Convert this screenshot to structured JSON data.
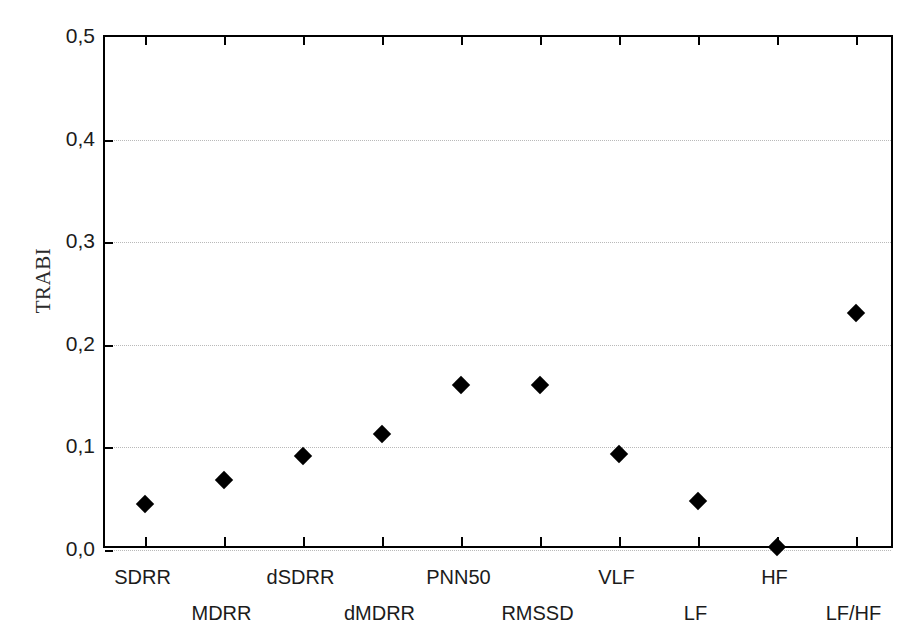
{
  "chart_data": {
    "type": "scatter",
    "title": "",
    "xlabel": "",
    "ylabel": "TRABI",
    "categories": [
      "SDRR",
      "MDRR",
      "dSDRR",
      "dMDRR",
      "PNN50",
      "RMSSD",
      "VLF",
      "LF",
      "HF",
      "LF/HF"
    ],
    "values": [
      0.045,
      0.068,
      0.092,
      0.113,
      0.161,
      0.161,
      0.094,
      0.048,
      0.003,
      0.231
    ],
    "ylim": [
      0.0,
      0.5
    ],
    "ytick_values": [
      0.0,
      0.1,
      0.2,
      0.3,
      0.4,
      0.5
    ],
    "ytick_labels": [
      "0,0",
      "0,1",
      "0,2",
      "0,3",
      "0,4",
      "0,5"
    ],
    "grid": true,
    "grid_axis": "y",
    "legend": "none",
    "marker": "diamond",
    "marker_color": "#000000",
    "grid_color": "#b9b9b9",
    "axis_color": "#000000",
    "series": [
      {
        "name": "TRABI",
        "points": [
          {
            "category": "SDRR",
            "value": 0.045
          },
          {
            "category": "MDRR",
            "value": 0.068
          },
          {
            "category": "dSDRR",
            "value": 0.092
          },
          {
            "category": "dMDRR",
            "value": 0.113
          },
          {
            "category": "PNN50",
            "value": 0.161
          },
          {
            "category": "RMSSD",
            "value": 0.161
          },
          {
            "category": "VLF",
            "value": 0.094
          },
          {
            "category": "LF",
            "value": 0.048
          },
          {
            "category": "HF",
            "value": 0.003
          },
          {
            "category": "LF/HF",
            "value": 0.231
          }
        ]
      }
    ]
  }
}
